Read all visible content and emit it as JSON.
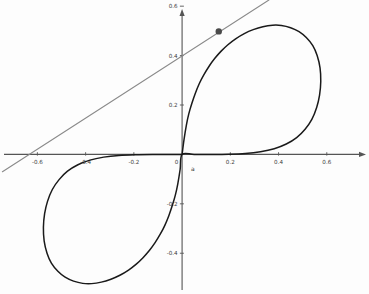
{
  "figure": {
    "background_color": "#fdfdfd",
    "width": 369,
    "height": 294
  },
  "chart_data": {
    "type": "line",
    "title": "",
    "subtitle": "",
    "xlabel": "",
    "ylabel": "",
    "grid": false,
    "legend_position": "none",
    "xlim": [
      -0.755,
      0.775
    ],
    "ylim": [
      -0.565,
      0.625
    ],
    "axis_color": "#555555",
    "xticks": [
      -0.6,
      -0.4,
      -0.2,
      0,
      0.2,
      0.4,
      0.6
    ],
    "xtick_labels": [
      "-0.6",
      "-0.4",
      "-0.2",
      "0",
      "0.2",
      "0.4",
      "0.6"
    ],
    "yticks": [
      -0.4,
      -0.2,
      0.2,
      0.4,
      0.6
    ],
    "ytick_labels": [
      "-0.4",
      "-0.2",
      "0.2",
      "0.4",
      "0.6"
    ],
    "annotations": [
      {
        "text": "a",
        "x": 0.045,
        "y": -0.03,
        "name": "origin-parameter-label"
      }
    ],
    "series": [
      {
        "name": "figure-eight-curve",
        "type": "parametric-closed-curve",
        "color": "#1a1a1a",
        "line_width": 1.5,
        "description": "Lemniscate-type figure-eight curve passing through the origin with a vertical tangent; right lobe in the first quadrant reaching x max 0.575, left lobe in the third quadrant reaching x min -0.575.",
        "x_extent": [
          -0.575,
          0.575
        ],
        "y_extent": [
          -0.525,
          0.525
        ],
        "points": [
          [
            0.0,
            0.0
          ],
          [
            0.008,
            0.06
          ],
          [
            0.018,
            0.12
          ],
          [
            0.028,
            0.165
          ],
          [
            0.04,
            0.205
          ],
          [
            0.055,
            0.248
          ],
          [
            0.072,
            0.288
          ],
          [
            0.09,
            0.322
          ],
          [
            0.112,
            0.357
          ],
          [
            0.135,
            0.388
          ],
          [
            0.162,
            0.418
          ],
          [
            0.19,
            0.444
          ],
          [
            0.222,
            0.468
          ],
          [
            0.258,
            0.489
          ],
          [
            0.295,
            0.505
          ],
          [
            0.335,
            0.517
          ],
          [
            0.375,
            0.523
          ],
          [
            0.412,
            0.522
          ],
          [
            0.45,
            0.513
          ],
          [
            0.485,
            0.497
          ],
          [
            0.515,
            0.473
          ],
          [
            0.542,
            0.44
          ],
          [
            0.56,
            0.4
          ],
          [
            0.572,
            0.35
          ],
          [
            0.575,
            0.295
          ],
          [
            0.57,
            0.24
          ],
          [
            0.558,
            0.19
          ],
          [
            0.538,
            0.142
          ],
          [
            0.51,
            0.102
          ],
          [
            0.475,
            0.068
          ],
          [
            0.432,
            0.042
          ],
          [
            0.382,
            0.023
          ],
          [
            0.325,
            0.011
          ],
          [
            0.262,
            0.004
          ],
          [
            0.195,
            0.001
          ],
          [
            0.12,
            0.0
          ],
          [
            0.05,
            0.0
          ],
          [
            0.0,
            0.0
          ],
          [
            -0.008,
            -0.06
          ],
          [
            -0.018,
            -0.12
          ],
          [
            -0.028,
            -0.165
          ],
          [
            -0.04,
            -0.205
          ],
          [
            -0.055,
            -0.248
          ],
          [
            -0.072,
            -0.288
          ],
          [
            -0.09,
            -0.322
          ],
          [
            -0.112,
            -0.357
          ],
          [
            -0.135,
            -0.388
          ],
          [
            -0.162,
            -0.418
          ],
          [
            -0.19,
            -0.444
          ],
          [
            -0.222,
            -0.468
          ],
          [
            -0.258,
            -0.489
          ],
          [
            -0.295,
            -0.505
          ],
          [
            -0.335,
            -0.517
          ],
          [
            -0.375,
            -0.523
          ],
          [
            -0.412,
            -0.522
          ],
          [
            -0.45,
            -0.513
          ],
          [
            -0.485,
            -0.497
          ],
          [
            -0.515,
            -0.473
          ],
          [
            -0.542,
            -0.44
          ],
          [
            -0.56,
            -0.4
          ],
          [
            -0.572,
            -0.35
          ],
          [
            -0.575,
            -0.295
          ],
          [
            -0.57,
            -0.24
          ],
          [
            -0.558,
            -0.19
          ],
          [
            -0.538,
            -0.142
          ],
          [
            -0.51,
            -0.102
          ],
          [
            -0.475,
            -0.068
          ],
          [
            -0.432,
            -0.042
          ],
          [
            -0.382,
            -0.023
          ],
          [
            -0.325,
            -0.011
          ],
          [
            -0.262,
            -0.004
          ],
          [
            -0.195,
            -0.001
          ],
          [
            -0.12,
            0.0
          ],
          [
            -0.05,
            0.0
          ],
          [
            0.0,
            0.0
          ]
        ]
      },
      {
        "name": "tangent-line",
        "type": "line",
        "color": "#8a8a8a",
        "line_width": 1.1,
        "description": "Straight tangent line touching the curve at the marked point; crosses the x-axis near x = -0.63 and the y-axis near y = 0.40.",
        "slope": 0.63,
        "y_intercept": 0.4,
        "x_intercept": -0.63,
        "endpoints": [
          [
            -0.745,
            -0.07
          ],
          [
            0.36,
            0.625
          ]
        ]
      }
    ],
    "markers": [
      {
        "name": "tangency-point",
        "x": 0.152,
        "y": 0.498,
        "color": "#4a4a4a",
        "radius": 3.2,
        "label": ""
      }
    ]
  }
}
